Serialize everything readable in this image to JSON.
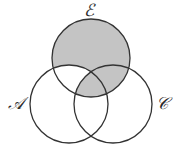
{
  "diagram": {
    "type": "venn-3-set",
    "shaded_region": "E minus (A minus C)",
    "colors": {
      "shade": "#c4c4c4",
      "stroke": "#333333",
      "background": "#ffffff"
    },
    "sets": [
      {
        "id": "E",
        "label": "ℰ",
        "cx": 91,
        "cy": 58,
        "r": 39
      },
      {
        "id": "A",
        "label": "𝒜",
        "cx": 69,
        "cy": 104,
        "r": 39
      },
      {
        "id": "C",
        "label": "𝒞",
        "cx": 113,
        "cy": 104,
        "r": 39
      }
    ],
    "labels": {
      "E": "ℰ",
      "A": "𝒜",
      "C": "𝒞"
    }
  }
}
